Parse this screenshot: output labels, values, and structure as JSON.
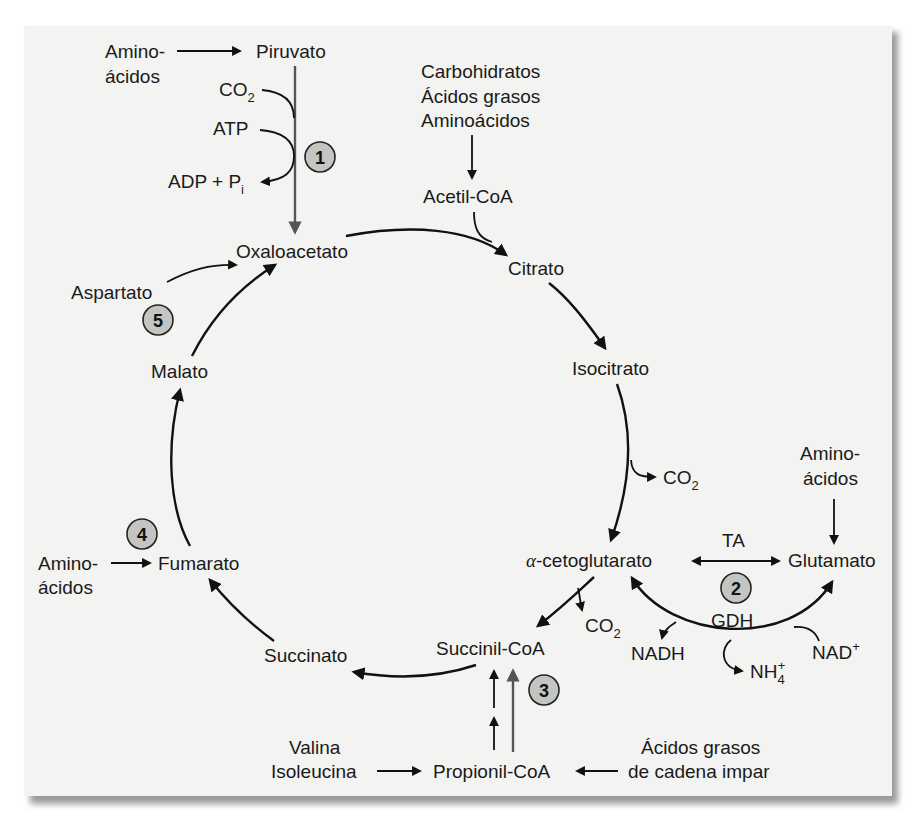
{
  "diagram": {
    "cycle_intermediates": {
      "oxaloacetato": "Oxaloacetato",
      "citrato": "Citrato",
      "isocitrato": "Isocitrato",
      "alfa_cetoglutarato_prefix": "α",
      "alfa_cetoglutarato": "-cetoglutarato",
      "succinil_coa": "Succinil-CoA",
      "succinato": "Succinato",
      "fumarato": "Fumarato",
      "malato": "Malato"
    },
    "inputs": {
      "piruvato": "Piruvato",
      "aminoacidos_piruvato_line1": "Amino-",
      "aminoacidos_piruvato_line2": "ácidos",
      "co2_in": "CO",
      "co2_in_sub": "2",
      "atp": "ATP",
      "adp_pi": "ADP + P",
      "adp_pi_sub": "i",
      "acetil_sources": [
        "Carbohidratos",
        "Ácidos grasos",
        "Aminoácidos"
      ],
      "acetil_coa": "Acetil-CoA",
      "aspartato": "Aspartato",
      "aminoacidos_fumarato_line1": "Amino-",
      "aminoacidos_fumarato_line2": "ácidos",
      "co2_isocitrato": "CO",
      "co2_isocitrato_sub": "2",
      "co2_akg": "CO",
      "co2_akg_sub": "2",
      "aminoacidos_glutamato_line1": "Amino-",
      "aminoacidos_glutamato_line2": "ácidos",
      "glutamato": "Glutamato",
      "ta": "TA",
      "gdh": "GDH",
      "nadh": "NADH",
      "nad_plus": "NAD",
      "nad_plus_sup": "+",
      "nh4": "NH",
      "nh4_sub": "4",
      "nh4_sup": "+",
      "valina": "Valina",
      "isoleucina": "Isoleucina",
      "propionil_coa": "Propionil-CoA",
      "acidos_grasos_impar_line1": "Ácidos grasos",
      "acidos_grasos_impar_line2": "de cadena impar"
    },
    "badges": [
      "1",
      "2",
      "3",
      "4",
      "5"
    ],
    "colors": {
      "panel_background": "#f3f3f1",
      "badge_fill": "#c4c4c2",
      "line": "#111111",
      "secondary_line": "#555555"
    }
  }
}
